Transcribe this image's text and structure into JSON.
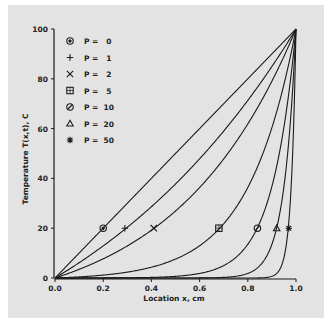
{
  "chart_data": {
    "type": "line",
    "title": "",
    "xlabel": "Location x, cm",
    "ylabel": "Temperature T(x,t), C",
    "xlim": [
      0.0,
      1.0
    ],
    "ylim": [
      0,
      100
    ],
    "xticks": [
      "0.0",
      "0.2",
      "0.4",
      "0.6",
      "0.8",
      "1.0"
    ],
    "yticks": [
      "0",
      "20",
      "40",
      "60",
      "80",
      "100"
    ],
    "grid": false,
    "legend_position": "upper left",
    "x": [
      0.0,
      0.1,
      0.2,
      0.3,
      0.4,
      0.5,
      0.6,
      0.7,
      0.8,
      0.9,
      0.95,
      1.0
    ],
    "series": [
      {
        "name": "P = 0",
        "marker": "diamond-circle",
        "marker_point": [
          0.2,
          20
        ],
        "values": [
          0,
          10,
          20,
          30,
          40,
          50,
          60,
          70,
          80,
          90,
          95,
          100
        ]
      },
      {
        "name": "P = 1",
        "marker": "plus",
        "marker_point": [
          0.29,
          20
        ],
        "values": [
          0,
          6.1,
          12.9,
          20.6,
          28.7,
          37.8,
          47.7,
          58.5,
          71.0,
          84.8,
          92.2,
          100
        ]
      },
      {
        "name": "P = 2",
        "marker": "x",
        "marker_point": [
          0.41,
          20
        ],
        "values": [
          0,
          3.5,
          7.7,
          12.8,
          19.0,
          26.9,
          36.4,
          48.0,
          62.1,
          79.3,
          89.1,
          100
        ]
      },
      {
        "name": "P = 5",
        "marker": "square",
        "marker_point": [
          0.68,
          20
        ],
        "values": [
          0,
          0.4,
          1.2,
          2.6,
          4.9,
          8.2,
          13.4,
          22.0,
          36.1,
          60.6,
          77.8,
          100
        ]
      },
      {
        "name": "P = 10",
        "marker": "circle-slash",
        "marker_point": [
          0.84,
          20
        ],
        "values": [
          0,
          0.0,
          0.0,
          0.0,
          0.2,
          0.7,
          1.8,
          5.0,
          13.5,
          36.8,
          60.6,
          100
        ]
      },
      {
        "name": "P = 20",
        "marker": "triangle",
        "marker_point": [
          0.92,
          20
        ],
        "values": [
          0,
          0,
          0,
          0,
          0,
          0,
          0.0,
          0.2,
          1.8,
          13.5,
          36.8,
          100
        ]
      },
      {
        "name": "P = 50",
        "marker": "asterisk",
        "marker_point": [
          0.97,
          20
        ],
        "values": [
          0,
          0,
          0,
          0,
          0,
          0,
          0,
          0,
          0,
          0.7,
          8.2,
          100
        ]
      }
    ],
    "annotations": []
  },
  "legend": {
    "items": [
      {
        "symbol": "diamond-circle",
        "label": "P =   0"
      },
      {
        "symbol": "plus",
        "label": "P =   1"
      },
      {
        "symbol": "x",
        "label": "P =   2"
      },
      {
        "symbol": "square",
        "label": "P =   5"
      },
      {
        "symbol": "circle-slash",
        "label": "P =  10"
      },
      {
        "symbol": "triangle",
        "label": "P =  20"
      },
      {
        "symbol": "asterisk",
        "label": "P =  50"
      }
    ]
  },
  "colors": {
    "panel_background": "#e3e3e3",
    "line": "#1a1a1a",
    "text": "#222222"
  }
}
